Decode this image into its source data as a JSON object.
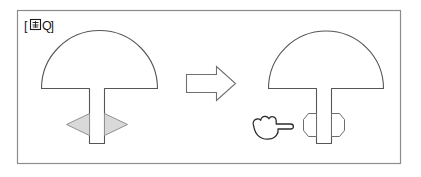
{
  "figure": {
    "label_open_bracket": "[",
    "label_glyph_name": "figure-kanji-glyph",
    "label_letter": "Q",
    "label_close_bracket": "]",
    "label_full": "[図Q]",
    "caption_hidden": "",
    "panel": {
      "background_color": "#ffffff",
      "border_color": "#8c8c8c"
    },
    "before": {
      "name": "before-state",
      "shape_name": "dome-with-stem",
      "handles_name": "triangle-resize-handles",
      "handle_count": 2,
      "handle_fill": "#d9d9d9",
      "handle_stroke": "#8f9093",
      "handle_directions": [
        "left",
        "right"
      ]
    },
    "transition": {
      "name": "right-arrow",
      "direction": "right",
      "fill": "#ffffff",
      "stroke": "#6f7074"
    },
    "after": {
      "name": "after-state",
      "shape_name": "dome-with-stem",
      "handles_name": "octagon-resize-handles",
      "handle_count": 2,
      "handle_fill": "#ffffff",
      "handle_stroke": "#6b6c70",
      "cursor_name": "pointing-hand-cursor",
      "cursor_direction": "right"
    },
    "outline_color": "#55565a"
  }
}
